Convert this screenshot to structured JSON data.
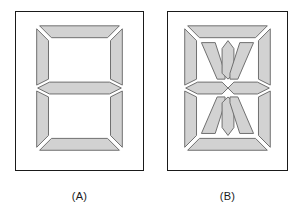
{
  "figure": {
    "background_color": "#ffffff"
  },
  "panels": [
    {
      "id": "A",
      "caption": "(A)",
      "display_type": "seven-segment",
      "segment_count": 7,
      "segment_names": [
        "a",
        "b",
        "c",
        "d",
        "e",
        "f",
        "g"
      ],
      "frame_color": "#1a1a1a",
      "segment_fill": "#d2d2d2",
      "segment_stroke": "#6e6e6e",
      "panel_fill": "#ffffff"
    },
    {
      "id": "B",
      "caption": "(B)",
      "display_type": "fourteen-segment",
      "segment_count": 14,
      "segment_names": [
        "a",
        "b",
        "c",
        "d",
        "e",
        "f",
        "g1",
        "g2",
        "h",
        "i",
        "j",
        "k",
        "l",
        "m"
      ],
      "frame_color": "#1a1a1a",
      "segment_fill": "#d2d2d2",
      "segment_stroke": "#6e6e6e",
      "panel_fill": "#ffffff"
    }
  ],
  "colors": {
    "segment_fill": "#d2d2d2",
    "segment_outline": "#6e6e6e",
    "frame_outline": "#1a1a1a",
    "background": "#ffffff",
    "caption_text": "#1a1a1a"
  }
}
